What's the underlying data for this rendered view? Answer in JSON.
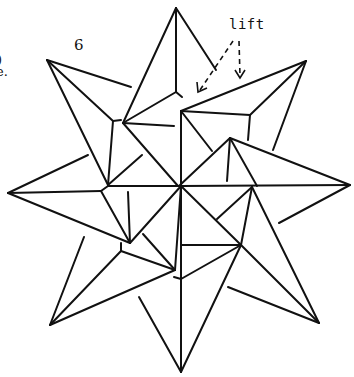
{
  "diagram": {
    "step_number": "6",
    "annotation": "lift",
    "cropped_left_text": [
      ")",
      "e."
    ],
    "colors": {
      "ink": "#111111",
      "background": "#ffffff"
    },
    "arrows": [
      {
        "style": "dashed",
        "from": [
          232,
          42
        ],
        "to": [
          199,
          92
        ]
      },
      {
        "style": "dashed",
        "from": [
          239,
          42
        ],
        "to": [
          240,
          78
        ]
      }
    ]
  }
}
